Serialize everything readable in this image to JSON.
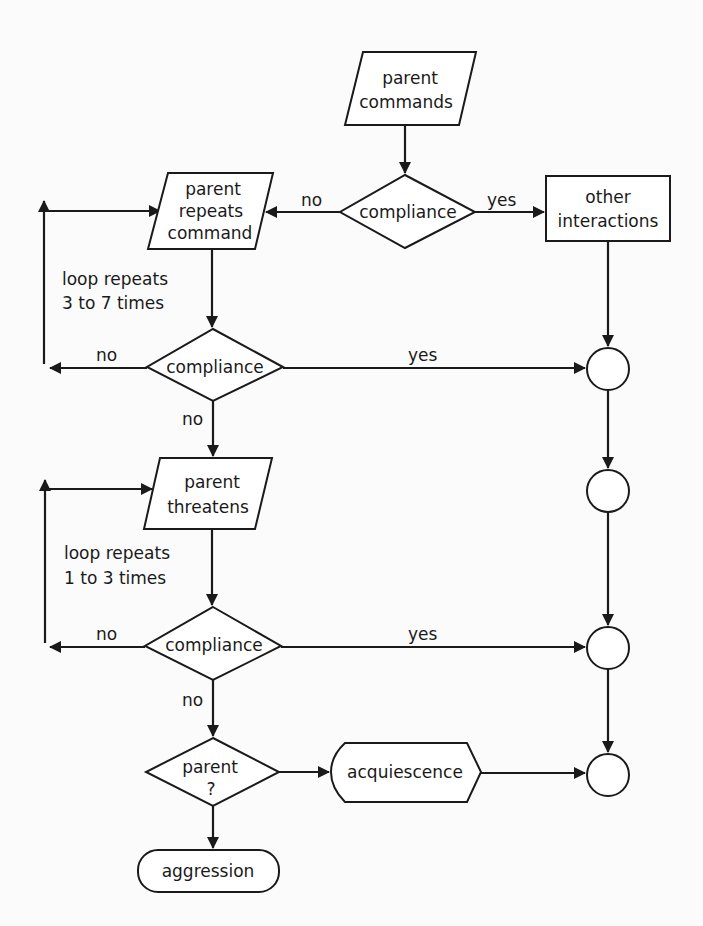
{
  "diagram": {
    "type": "flowchart",
    "colors": {
      "ink": "#1a1a1a",
      "background": "#fbfbfb",
      "fill": "#ffffff"
    },
    "nodes": {
      "parent_commands": {
        "shape": "parallelogram",
        "line1": "parent",
        "line2": "commands"
      },
      "compliance_1": {
        "shape": "diamond",
        "label": "compliance"
      },
      "other_interactions": {
        "shape": "rectangle",
        "line1": "other",
        "line2": "interactions"
      },
      "parent_repeats_command": {
        "shape": "parallelogram",
        "line1": "parent",
        "line2": "repeats",
        "line3": "command"
      },
      "compliance_2": {
        "shape": "diamond",
        "label": "compliance"
      },
      "parent_threatens": {
        "shape": "parallelogram",
        "line1": "parent",
        "line2": "threatens"
      },
      "compliance_3": {
        "shape": "diamond",
        "label": "compliance"
      },
      "parent_decision": {
        "shape": "diamond",
        "line1": "parent",
        "line2": "?"
      },
      "acquiescence": {
        "shape": "terminal",
        "label": "acquiescence"
      },
      "aggression": {
        "shape": "pill",
        "label": "aggression"
      },
      "connectors": [
        "circle-1",
        "circle-2",
        "circle-3",
        "circle-4"
      ]
    },
    "edge_labels": {
      "c1_no": "no",
      "c1_yes": "yes",
      "c2_no_left": "no",
      "c2_yes": "yes",
      "c2_no_down": "no",
      "c3_no_left": "no",
      "c3_yes": "yes",
      "c3_no_down": "no"
    },
    "annotations": {
      "loop1_line1": "loop repeats",
      "loop1_line2": "3 to 7 times",
      "loop2_line1": "loop repeats",
      "loop2_line2": "1 to 3 times"
    }
  }
}
